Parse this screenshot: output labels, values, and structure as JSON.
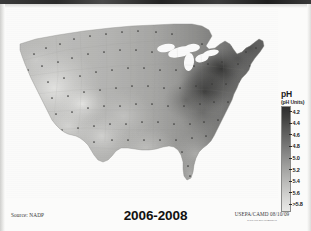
{
  "figure": {
    "title": "2006-2008",
    "source_label": "Source: NADP",
    "credit": "USEPA/CAMD 08/10/09",
    "credit_url": "www.epa.gov/airmarkets"
  },
  "legend": {
    "title": "pH",
    "subtitle": "(pH Units)",
    "ticks": [
      {
        "label": "4.2"
      },
      {
        "label": "4.4"
      },
      {
        "label": "4.6"
      },
      {
        "label": "4.8"
      },
      {
        "label": "5.0"
      },
      {
        "label": "5.2"
      },
      {
        "label": "5.4"
      },
      {
        "label": "5.6"
      },
      {
        "label": ">5.8"
      }
    ],
    "dark_end_color": "#2e2e2e",
    "light_end_color": "#e9e9e7"
  },
  "chart_data": {
    "type": "heatmap",
    "title": "2006-2008",
    "subtitle": "Hydrogen ion concentration as pH from measurements made at the Central Analytical Laboratory",
    "xlabel": "",
    "ylabel": "",
    "grid": false,
    "legend_position": "right",
    "colorbar": {
      "label": "pH",
      "units": "(pH Units)",
      "tick_values": [
        4.2,
        4.4,
        4.6,
        4.8,
        5.0,
        5.2,
        5.4,
        5.6,
        5.8
      ],
      "tick_labels": [
        "4.2",
        "4.4",
        "4.6",
        "4.8",
        "5.0",
        "5.2",
        "5.4",
        "5.6",
        ">5.8"
      ],
      "range": [
        4.2,
        5.8
      ],
      "orientation": "vertical",
      "dark_is_low_ph": true
    },
    "regions": [
      {
        "name": "Pacific Northwest",
        "ph": 5.4
      },
      {
        "name": "California",
        "ph": 5.5
      },
      {
        "name": "Great Basin / Nevada",
        "ph": 5.6
      },
      {
        "name": "Southwest / Arizona",
        "ph": 5.6
      },
      {
        "name": "Northern Rockies",
        "ph": 5.4
      },
      {
        "name": "Colorado Rockies",
        "ph": 5.3
      },
      {
        "name": "Northern Plains",
        "ph": 5.4
      },
      {
        "name": "Central Plains / Kansas",
        "ph": 5.2
      },
      {
        "name": "Texas",
        "ph": 5.2
      },
      {
        "name": "Upper Midwest",
        "ph": 5.0
      },
      {
        "name": "Great Lakes",
        "ph": 4.7
      },
      {
        "name": "Ohio River Valley",
        "ph": 4.4
      },
      {
        "name": "Western Pennsylvania",
        "ph": 4.3
      },
      {
        "name": "Northeast / New York",
        "ph": 4.5
      },
      {
        "name": "New England",
        "ph": 4.7
      },
      {
        "name": "Mid-Atlantic",
        "ph": 4.6
      },
      {
        "name": "Southern Appalachians",
        "ph": 4.7
      },
      {
        "name": "Southeast / Georgia",
        "ph": 4.9
      },
      {
        "name": "Gulf Coast",
        "ph": 5.0
      },
      {
        "name": "Florida",
        "ph": 5.1
      }
    ],
    "monitoring_sites_shown": true,
    "minimum_ph_location": "Ohio River Valley / Western Pennsylvania",
    "maximum_ph_location": "Intermountain West"
  }
}
